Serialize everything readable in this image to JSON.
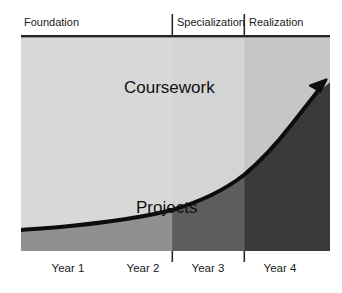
{
  "chart_data": {
    "type": "area",
    "title": "",
    "subtitle": "",
    "xlabel": "",
    "ylabel": "",
    "grid": false,
    "legend_position": "none",
    "x_axis": {
      "tick_labels": [
        "Year 1",
        "Year 2",
        "Year 3",
        "Year 4"
      ],
      "tick_centers_pct": [
        12.5,
        37.5,
        62.5,
        87.5
      ]
    },
    "phases": [
      {
        "label": "Foundation",
        "start_pct": 0.0,
        "end_pct": 48.9,
        "band_top_color": "#d8d8d8",
        "band_bottom_color": "#909090"
      },
      {
        "label": "Specialization",
        "start_pct": 48.9,
        "end_pct": 72.2,
        "band_top_color": "#d4d4d4",
        "band_bottom_color": "#5d5d5d"
      },
      {
        "label": "Realization",
        "start_pct": 72.2,
        "end_pct": 100.0,
        "band_top_color": "#c6c6c6",
        "band_bottom_color": "#3a3a3a"
      }
    ],
    "series": [
      {
        "name": "Coursework",
        "region": "upper",
        "label_x_pct": 36,
        "label_y_pct": 22
      },
      {
        "name": "Projects",
        "region": "lower",
        "label_x_pct": 40,
        "label_y_pct": 78
      }
    ],
    "divider_curve": {
      "description": "Rising dark curve separating Projects (below) from Coursework (above); terminates in an arrowhead at the upper right.",
      "points_pct": [
        {
          "x": 0,
          "y": 77
        },
        {
          "x": 25,
          "y": 72
        },
        {
          "x": 50,
          "y": 64
        },
        {
          "x": 70,
          "y": 53
        },
        {
          "x": 85,
          "y": 39
        },
        {
          "x": 97,
          "y": 22
        }
      ],
      "color": "#0d0d0d",
      "width_px": 4,
      "arrowhead": true
    },
    "plot_rect_px": {
      "x": 21,
      "y": 38,
      "width": 309,
      "height": 213
    }
  },
  "header": {
    "phase_labels": [
      "Foundation",
      "Specialization",
      "Realization"
    ]
  },
  "footer": {
    "year_labels": [
      "Year 1",
      "Year 2",
      "Year 3",
      "Year 4"
    ]
  },
  "regions": {
    "upper_label": "Coursework",
    "lower_label": "Projects"
  },
  "colors": {
    "background": "#ffffff",
    "rule": "#262626",
    "curve": "#0d0d0d",
    "text": "#1a1a1a",
    "foundation_top": "#d8d8d8",
    "foundation_bottom": "#909090",
    "specialization_top": "#d4d4d4",
    "specialization_bottom": "#5d5d5d",
    "realization_top": "#c6c6c6",
    "realization_bottom": "#3a3a3a"
  }
}
